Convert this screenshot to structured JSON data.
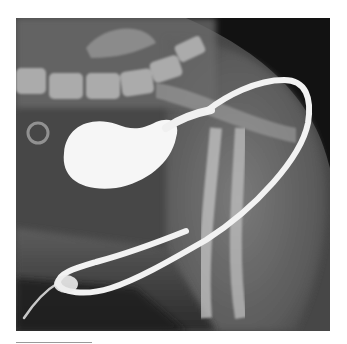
{
  "figure": {
    "type": "radiograph",
    "colors": {
      "background": "#ffffff",
      "film_dark": "#1a1a1a",
      "soft_tissue": "#6e6e6e",
      "bone": "#c8c8c8",
      "contrast": "#f6f6f6"
    }
  },
  "rule": {
    "color": "#9a9a9a"
  }
}
